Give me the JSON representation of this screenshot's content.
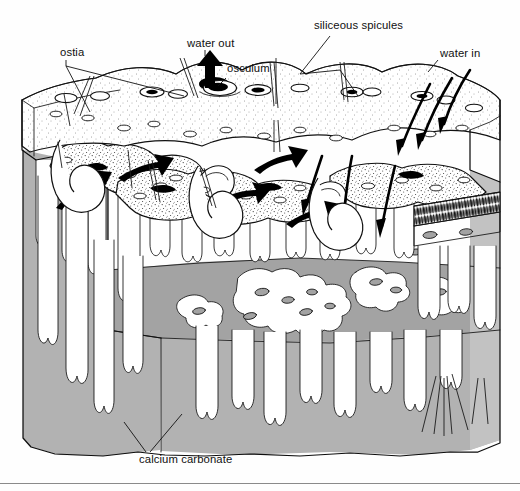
{
  "figure": {
    "type": "scientific-line-diagram",
    "background_color": "#ffffff",
    "ink_color": "#101010",
    "rock_fill_color": "#b2b2b2",
    "tissue_fill_color": "#ffffff",
    "osculum_fill_color": "#000000"
  },
  "labels": [
    {
      "id": "ostia",
      "text": "ostia",
      "x": 60,
      "y": 56,
      "anchor": "start"
    },
    {
      "id": "water-out",
      "text": "water out",
      "x": 187,
      "y": 47,
      "anchor": "start"
    },
    {
      "id": "osculum",
      "text": "osculum",
      "x": 227,
      "y": 72,
      "anchor": "start"
    },
    {
      "id": "siliceous-spicules",
      "text": "siliceous spicules",
      "x": 314,
      "y": 29,
      "anchor": "start"
    },
    {
      "id": "water-in",
      "text": "water in",
      "x": 440,
      "y": 57,
      "anchor": "start"
    },
    {
      "id": "calcium-carbonate",
      "text": "calcium carbonate",
      "x": 139,
      "y": 463,
      "anchor": "start"
    }
  ],
  "annotations": {
    "ostia_description": "small surface pores of the sponge",
    "osculum_description": "large excurrent opening",
    "water_out_description": "exhalant current leaving the osculum",
    "water_in_description": "inhalant currents entering the ostia",
    "spicules_description": "siliceous spicules projecting from the sponge surface",
    "substrate_description": "calcium carbonate rock excavated by the sponge"
  },
  "arrows": {
    "water_out": {
      "direction": "up",
      "style": "thick-solid-black",
      "count": 1
    },
    "water_in": {
      "direction": "down-left",
      "style": "tapered-black",
      "count": 6
    }
  },
  "page": {
    "rule_visible": true,
    "rule_y": 483
  }
}
